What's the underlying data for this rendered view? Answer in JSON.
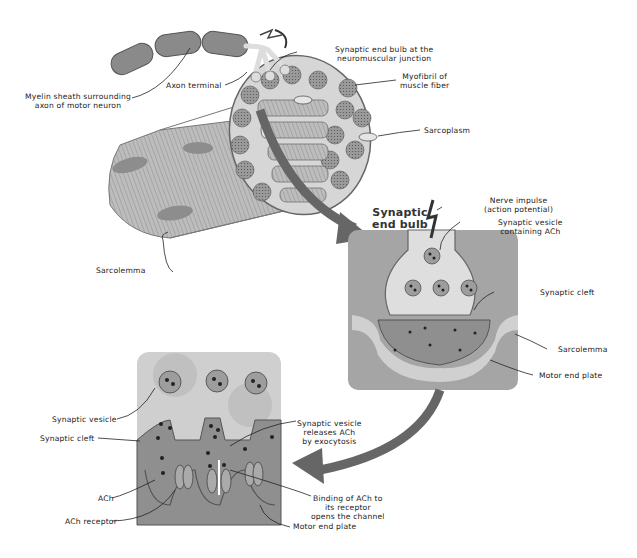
{
  "diagram": {
    "title": "Neuromuscular junction",
    "colors": {
      "muscle_dark": "#8a8a8a",
      "muscle_light": "#c9c9c9",
      "inset_bg": "#a5a5a5",
      "cleft": "#8f8f8f",
      "vesicle": "#9d9d9d",
      "arrow": "#666666"
    },
    "top_panel": {
      "labels": {
        "myelin": [
          "Myelin sheath surrounding",
          "axon of motor neuron"
        ],
        "axon_terminal": "Axon terminal",
        "end_bulb_nmj": [
          "Synaptic end bulb at the",
          "neuromuscular junction"
        ],
        "myofibril": [
          "Myofibril of",
          "muscle fiber"
        ],
        "sarcoplasm": "Sarcoplasm",
        "sarcolemma": "Sarcolemma"
      }
    },
    "middle_panel": {
      "heading": [
        "Synaptic",
        "end bulb"
      ],
      "labels": {
        "nerve_impulse": [
          "Nerve impulse",
          "(action potential)"
        ],
        "vesicle_ach": [
          "Synaptic vesicle",
          "containing ACh"
        ],
        "synaptic_cleft": "Synaptic cleft",
        "sarcolemma": "Sarcolemma",
        "motor_end_plate": "Motor end plate"
      }
    },
    "bottom_panel": {
      "labels": {
        "synaptic_vesicle": "Synaptic vesicle",
        "synaptic_cleft": "Synaptic cleft",
        "ach": "ACh",
        "ach_receptor": "ACh receptor",
        "exocytosis": [
          "Synaptic vesicle",
          "releases ACh",
          "by exocytosis"
        ],
        "binding": [
          "Binding of ACh to",
          "its receptor",
          "opens the channel"
        ],
        "motor_end_plate": "Motor end plate"
      }
    }
  }
}
